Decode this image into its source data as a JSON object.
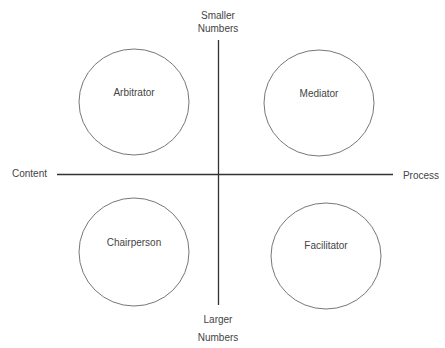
{
  "axes": {
    "top_label_line1": "Smaller",
    "top_label_line2": "Numbers",
    "bottom_label_line1": "Larger",
    "bottom_label_line2": "Numbers",
    "left_label": "Content",
    "right_label": "Process"
  },
  "quadrants": [
    {
      "label": "Arbitrator",
      "position": "top-left"
    },
    {
      "label": "Mediator",
      "position": "top-right"
    },
    {
      "label": "Chairperson",
      "position": "bottom-left"
    },
    {
      "label": "Facilitator",
      "position": "bottom-right"
    }
  ],
  "colors": {
    "axis": "#333333",
    "circle": "#777777",
    "text": "#444444"
  }
}
